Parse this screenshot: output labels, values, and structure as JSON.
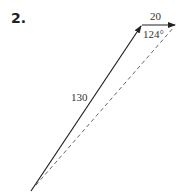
{
  "problem": {
    "number": "2."
  },
  "diagram": {
    "vector_a": {
      "magnitude_label": "130",
      "style": "solid"
    },
    "vector_b": {
      "magnitude_label": "20",
      "style": "solid"
    },
    "resultant": {
      "style": "dashed"
    },
    "angle": {
      "label": "124°"
    },
    "colors": {
      "line": "#222222",
      "dashed": "#555555",
      "text": "#333333"
    }
  }
}
